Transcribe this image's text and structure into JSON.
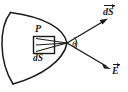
{
  "figure": {
    "domain": "diagram",
    "caption": "Electric flux through a curved surface: area element dS at point P with field E making angle theta with the surface normal",
    "background_color": "#ffffff",
    "ink_color": "#1b1b1b",
    "labels": {
      "point": "P",
      "area_element": "dS",
      "angle": "θ",
      "vector_area": "dS",
      "vector_field": "E"
    },
    "elements": {
      "surface_name": "curved-crescent-surface",
      "area_patch_name": "area-element-square",
      "apex_name": "ray-apex",
      "ray_normal_name": "normal-vector-ray",
      "ray_field_name": "field-vector-ray"
    },
    "geometry": {
      "surface_top_tip": [
        10,
        12
      ],
      "surface_bottom_tip": [
        13,
        84
      ],
      "surface_right_vertex": [
        67,
        43
      ],
      "area_square": [
        33,
        36,
        22,
        18
      ],
      "ray_normal_end": [
        108,
        19
      ],
      "ray_field_end": [
        111,
        69
      ],
      "angle_arc_center": [
        67,
        43
      ]
    }
  }
}
